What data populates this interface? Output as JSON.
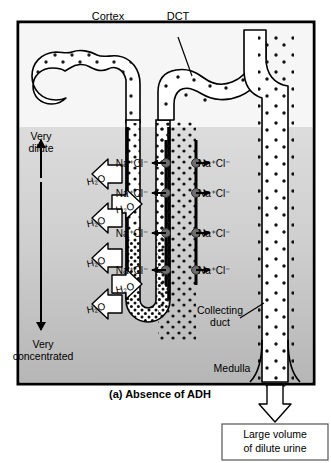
{
  "figure": {
    "caption": "(a) Absence of ADH",
    "panel_letter": "(a)",
    "region_labels": {
      "cortex": "Cortex",
      "medulla": "Medulla"
    },
    "structure_labels": {
      "dct": "DCT",
      "collecting_duct_line1": "Collecting",
      "collecting_duct_line2": "duct"
    },
    "gradient_axis": {
      "top_line1": "Very",
      "top_line2": "dilute",
      "bottom_line1": "Very",
      "bottom_line2": "concentrated"
    },
    "output_box": {
      "line1": "Large volume",
      "line2": "of dilute urine"
    },
    "solute_labels": [
      {
        "text": "Na⁺Cl⁻",
        "side": "left",
        "x": 148,
        "y": 163
      },
      {
        "text": "Na⁺Cl⁻",
        "side": "right",
        "x": 198,
        "y": 163
      },
      {
        "text": "Na⁺Cl⁻",
        "side": "left",
        "x": 148,
        "y": 193
      },
      {
        "text": "Na⁺Cl⁻",
        "side": "right",
        "x": 198,
        "y": 193
      },
      {
        "text": "Na⁺Cl⁻",
        "side": "left",
        "x": 148,
        "y": 233
      },
      {
        "text": "Na⁺Cl⁻",
        "side": "right",
        "x": 198,
        "y": 233
      },
      {
        "text": "Na⁺Cl⁻",
        "side": "left",
        "x": 148,
        "y": 270
      },
      {
        "text": "Na⁺Cl⁻",
        "side": "right",
        "x": 198,
        "y": 270
      }
    ],
    "water_labels": [
      {
        "text": "H₂O",
        "dir": "left",
        "cx": 96,
        "cy": 180
      },
      {
        "text": "H₂O",
        "dir": "right",
        "cx": 125,
        "cy": 208
      },
      {
        "text": "H₂O",
        "dir": "left",
        "cx": 96,
        "cy": 222
      },
      {
        "text": "H₂O",
        "dir": "left",
        "cx": 96,
        "cy": 262
      },
      {
        "text": "H₂O",
        "dir": "right",
        "cx": 125,
        "cy": 288
      },
      {
        "text": "H₂O",
        "dir": "left",
        "cx": 96,
        "cy": 308
      }
    ],
    "colors": {
      "frame_border": "#000000",
      "cortex_bg": "#f4f4f4",
      "medulla_bg_top": "#d9d9d9",
      "medulla_bg_bottom": "#b9b9b9",
      "tubule_stroke": "#000000",
      "tubule_fill": "#ffffff",
      "pump_fill": "#6e6e6e",
      "arrow_fill": "#ffffff",
      "text": "#000000"
    }
  }
}
